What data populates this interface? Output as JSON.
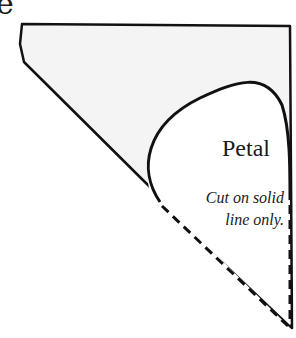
{
  "figure": {
    "corner_glyph": "e",
    "shape_label": "Petal",
    "instruction_line1": "Cut on solid",
    "instruction_line2": "line only.",
    "colors": {
      "stroke": "#111111",
      "paper_fill": "#f4f4f4",
      "petal_fill": "#ffffff"
    }
  }
}
